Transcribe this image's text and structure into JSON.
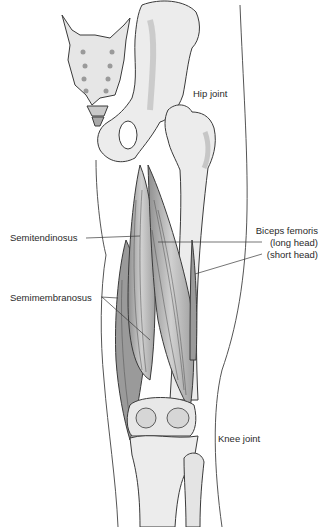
{
  "diagram": {
    "colors": {
      "bone": "#ececec",
      "bone_shade": "#bdbdbd",
      "muscle_light": "#cfcfcf",
      "muscle_dark": "#8a8a8a",
      "outline": "#3a3a3a",
      "leader": "#3a3a3a",
      "text": "#2a2a2a"
    },
    "labels": {
      "hip_joint": "Hip joint",
      "semitendinosus": "Semitendinosus",
      "biceps_femoris": "Biceps femoris",
      "long_head": "(long head)",
      "short_head": "(short head)",
      "semimembranosus": "Semimembranosus",
      "knee_joint": "Knee joint"
    }
  }
}
